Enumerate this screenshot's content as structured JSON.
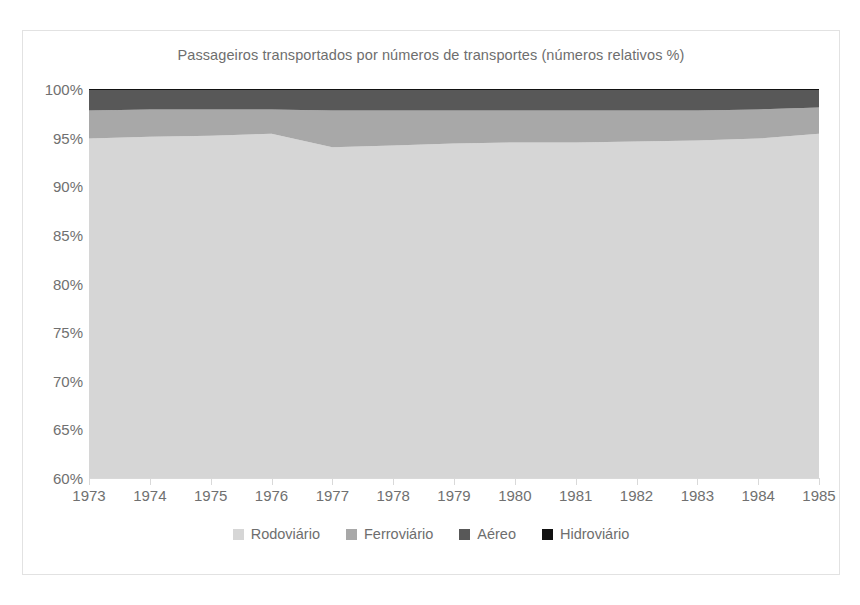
{
  "chart_data": {
    "type": "area",
    "stacked": true,
    "stack_percent": true,
    "title": "Passageiros transportados por números de transportes (números relativos %)",
    "xlabel": "",
    "ylabel": "",
    "ylim": [
      60,
      100
    ],
    "ytick_step": 5,
    "ytick_labels": [
      "100%",
      "95%",
      "90%",
      "85%",
      "80%",
      "75%",
      "70%",
      "65%",
      "60%"
    ],
    "ytick_values": [
      100,
      95,
      90,
      85,
      80,
      75,
      70,
      65,
      60
    ],
    "categories": [
      "1973",
      "1974",
      "1975",
      "1976",
      "1977",
      "1978",
      "1979",
      "1980",
      "1981",
      "1982",
      "1983",
      "1984",
      "1985"
    ],
    "x": [
      1973,
      1974,
      1975,
      1976,
      1977,
      1978,
      1979,
      1980,
      1981,
      1982,
      1983,
      1984,
      1985
    ],
    "grid": false,
    "legend_position": "bottom",
    "series": [
      {
        "name": "Rodoviário",
        "color": "#d6d6d6",
        "values": [
          94.9,
          95.1,
          95.2,
          95.4,
          94.0,
          94.2,
          94.4,
          94.5,
          94.5,
          94.6,
          94.7,
          94.9,
          95.4
        ]
      },
      {
        "name": "Ferroviário",
        "color": "#a8a8a8",
        "values": [
          2.9,
          2.8,
          2.7,
          2.5,
          3.8,
          3.6,
          3.4,
          3.3,
          3.3,
          3.2,
          3.1,
          3.0,
          2.7
        ]
      },
      {
        "name": "Aéreo",
        "color": "#585858",
        "values": [
          2.1,
          2.0,
          2.0,
          2.0,
          2.1,
          2.1,
          2.1,
          2.1,
          2.1,
          2.1,
          2.1,
          2.0,
          1.8
        ]
      },
      {
        "name": "Hidroviário",
        "color": "#121212",
        "values": [
          0.1,
          0.1,
          0.1,
          0.1,
          0.1,
          0.1,
          0.1,
          0.1,
          0.1,
          0.1,
          0.1,
          0.1,
          0.1
        ]
      }
    ]
  },
  "colors": {
    "frame_border": "#e2e2e2",
    "axis": "#d9d9d9",
    "text": "#6e6e6e",
    "background": "#ffffff"
  }
}
